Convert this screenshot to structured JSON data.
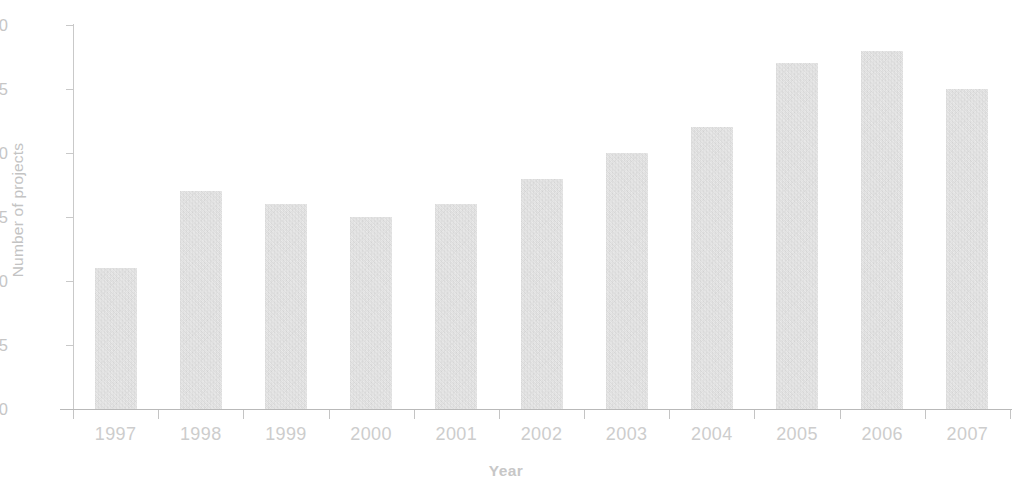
{
  "chart_data": {
    "type": "bar",
    "title": "",
    "subtitle": "",
    "xlabel": "Year",
    "ylabel": "Number of projects",
    "categories": [
      "1997",
      "1998",
      "1999",
      "2000",
      "2001",
      "2002",
      "2003",
      "2004",
      "2005",
      "2006",
      "2007"
    ],
    "values": [
      11,
      17,
      16,
      15,
      16,
      18,
      20,
      22,
      27,
      28,
      25
    ],
    "ylim": [
      0,
      30
    ],
    "ytick_labels": [
      "0",
      "5",
      "10",
      "15",
      "20",
      "25",
      "30"
    ],
    "ytick_values": [
      0,
      5,
      10,
      15,
      20,
      25,
      30
    ],
    "grid": false,
    "legend": null,
    "legend_position": "none",
    "annotations": [],
    "colors": {
      "bar_fill": "#dadada",
      "axis_line": "#c4c4c4",
      "tick_label": "#c9c9c9",
      "axis_title": "#c6c6c6",
      "background": "#ffffff"
    }
  }
}
